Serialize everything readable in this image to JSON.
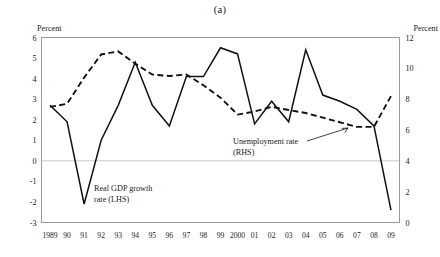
{
  "figure": {
    "panel_label": "(a)",
    "left_axis_unit": "Percent",
    "right_axis_unit": "Percent"
  },
  "annotations": {
    "gdp_line1": "Real GDP growth",
    "gdp_line2": "rate (LHS)",
    "unemp_line1": "Unemployment rate",
    "unemp_line2": "(RHS)"
  },
  "colors": {
    "ink": "#111111",
    "frame": "#9a9a9a",
    "zeroline": "#c8c8c8",
    "background": "#ffffff"
  },
  "chart_data": {
    "type": "line",
    "title": "(a)",
    "xlabel": "",
    "ylabel": "Percent",
    "y2label": "Percent",
    "grid": false,
    "legend": "annotations-inline",
    "ylim": [
      -3,
      6
    ],
    "y2lim": [
      0,
      12
    ],
    "yticks": [
      6,
      5,
      4,
      3,
      2,
      1,
      0,
      -1,
      -2,
      -3
    ],
    "ytick_labels": [
      "6",
      "5",
      "4",
      "3",
      "2",
      "1",
      "0",
      "-1",
      "-2",
      "-3"
    ],
    "y2ticks": [
      12,
      10,
      8,
      6,
      4,
      2,
      0
    ],
    "y2tick_labels": [
      "12",
      "10",
      "8",
      "6",
      "4",
      "2",
      "0"
    ],
    "categories": [
      "1989",
      "90",
      "91",
      "92",
      "93",
      "94",
      "95",
      "96",
      "97",
      "98",
      "99",
      "2000",
      "01",
      "02",
      "03",
      "04",
      "05",
      "06",
      "07",
      "08",
      "09"
    ],
    "x": [
      1989,
      1990,
      1991,
      1992,
      1993,
      1994,
      1995,
      1996,
      1997,
      1998,
      1999,
      2000,
      2001,
      2002,
      2003,
      2004,
      2005,
      2006,
      2007,
      2008,
      2009
    ],
    "series": [
      {
        "name": "Real GDP growth rate (LHS)",
        "axis": "left",
        "style": "solid",
        "values": [
          2.7,
          1.9,
          -2.1,
          1.0,
          2.7,
          4.8,
          2.7,
          1.7,
          4.1,
          4.1,
          5.5,
          5.2,
          1.8,
          2.9,
          1.9,
          5.4,
          3.2,
          2.9,
          2.5,
          1.7,
          -2.4
        ]
      },
      {
        "name": "Unemployment rate (RHS)",
        "axis": "right",
        "style": "dashed",
        "values": [
          7.5,
          7.7,
          9.4,
          10.9,
          11.1,
          10.3,
          9.6,
          9.5,
          9.6,
          8.9,
          8.1,
          7.0,
          7.2,
          7.5,
          7.3,
          7.1,
          6.8,
          6.5,
          6.2,
          6.2,
          8.2
        ]
      }
    ]
  }
}
